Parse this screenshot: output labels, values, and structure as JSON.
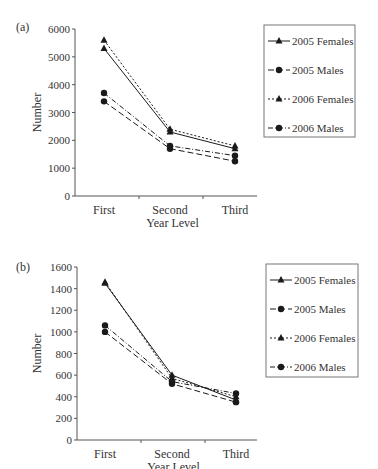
{
  "chart_data": [
    {
      "panel_label": "(a)",
      "type": "line",
      "title": "",
      "xlabel": "Year Level",
      "ylabel": "Number",
      "categories": [
        "First",
        "Second",
        "Third"
      ],
      "ylim": [
        0,
        6000
      ],
      "yticks": [
        0,
        1000,
        2000,
        3000,
        4000,
        5000,
        6000
      ],
      "grid": false,
      "legend_position": "right",
      "series": [
        {
          "name": "2005 Females",
          "marker": "triangle",
          "line": "solid",
          "values": [
            5300,
            2300,
            1700
          ]
        },
        {
          "name": "2005 Males",
          "marker": "circle",
          "line": "dashed",
          "values": [
            3400,
            1700,
            1250
          ]
        },
        {
          "name": "2006 Females",
          "marker": "triangle",
          "line": "dotted",
          "values": [
            5600,
            2400,
            1800
          ]
        },
        {
          "name": "2006 Males",
          "marker": "circle",
          "line": "dashdot",
          "values": [
            3700,
            1800,
            1450
          ]
        }
      ]
    },
    {
      "panel_label": "(b)",
      "type": "line",
      "title": "",
      "xlabel": "Year Level",
      "ylabel": "Number",
      "categories": [
        "First",
        "Second",
        "Third"
      ],
      "ylim": [
        0,
        1600
      ],
      "yticks": [
        0,
        200,
        400,
        600,
        800,
        1000,
        1200,
        1400,
        1600
      ],
      "grid": false,
      "legend_position": "right",
      "series": [
        {
          "name": "2005 Females",
          "marker": "triangle",
          "line": "solid",
          "values": [
            1450,
            600,
            370
          ]
        },
        {
          "name": "2005 Males",
          "marker": "circle",
          "line": "dashed",
          "values": [
            1000,
            520,
            350
          ]
        },
        {
          "name": "2006 Females",
          "marker": "triangle",
          "line": "dotted",
          "values": [
            1460,
            570,
            400
          ]
        },
        {
          "name": "2006 Males",
          "marker": "circle",
          "line": "dashdot",
          "values": [
            1060,
            540,
            430
          ]
        }
      ]
    }
  ],
  "colors": {
    "line": "#1a1a1a",
    "axis": "#555555",
    "text": "#333333",
    "legend_border": "#777777"
  }
}
